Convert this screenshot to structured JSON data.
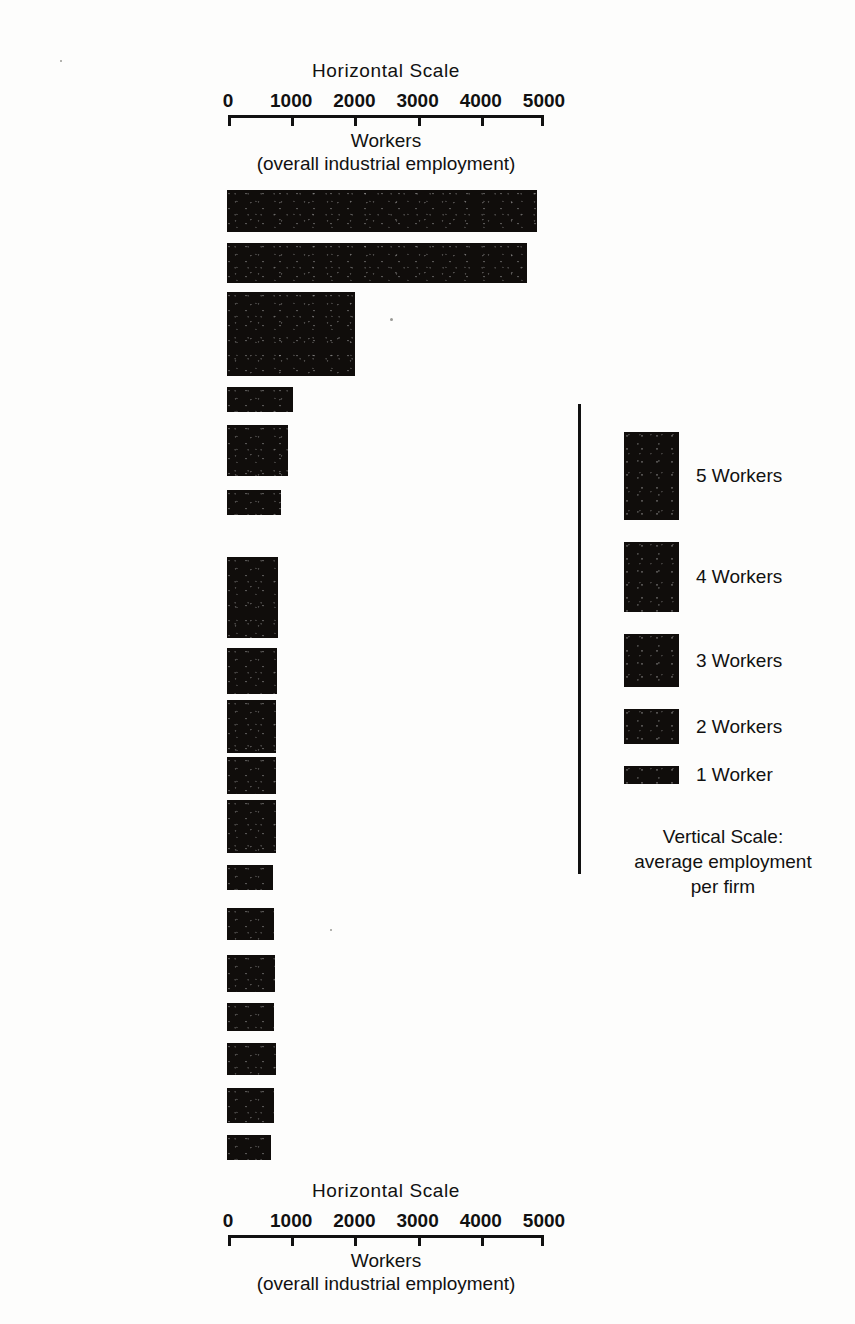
{
  "colors": {
    "bar": "#100d0b",
    "ink": "#111111",
    "page": "#fdfdfc"
  },
  "axis_top": {
    "title": "Horizontal Scale",
    "tick_labels": [
      "0",
      "1000",
      "2000",
      "3000",
      "4000",
      "5000"
    ],
    "tick_values": [
      0,
      1000,
      2000,
      3000,
      4000,
      5000
    ],
    "sub_label_1": "Workers",
    "sub_label_2": "(overall industrial employment)"
  },
  "axis_bottom": {
    "title": "Horizontal  Scale",
    "tick_labels": [
      "0",
      "1000",
      "2000",
      "3000",
      "4000",
      "5000"
    ],
    "tick_values": [
      0,
      1000,
      2000,
      3000,
      4000,
      5000
    ],
    "sub_label_1": "Workers",
    "sub_label_2": "(overall  industrial  employment)"
  },
  "legend": {
    "caption": "Vertical Scale:\naverage employment\nper firm",
    "entries": [
      {
        "label": "5 Workers",
        "workers": 5
      },
      {
        "label": "4 Workers",
        "workers": 4
      },
      {
        "label": "3 Workers",
        "workers": 3
      },
      {
        "label": "2 Workers",
        "workers": 2
      },
      {
        "label": "1 Worker",
        "workers": 1
      }
    ]
  },
  "chart_data": {
    "type": "bar",
    "title": "Horizontal Scale",
    "subtitle": "Workers (overall industrial employment)",
    "xlabel": "Workers (overall industrial employment)",
    "ylabel": "average employment per firm",
    "xlim": [
      0,
      5000
    ],
    "grid": false,
    "legend_position": "right",
    "categories": [
      "Tailoring",
      "Carpentry",
      "Motor repair",
      "Minor industries",
      "Baking",
      "Tinsmithing",
      "Printing",
      "Miscellaneous\nindustries",
      "Radio repair",
      "Blacksmithing",
      "Welding and battery\ncharging",
      "Shoe repair",
      "Photography",
      "Goldsmithing",
      "Mattress making",
      "Shoe making: rubber",
      "Shoe making",
      "Corn milling"
    ],
    "series": [
      {
        "name": "Workers (overall industrial employment)",
        "values": [
          4900,
          4740,
          2030,
          1050,
          960,
          860,
          810,
          790,
          780,
          780,
          780,
          720,
          740,
          760,
          740,
          780,
          740,
          700
        ]
      },
      {
        "name": "Average employment per firm (workers)",
        "values": [
          2.4,
          2.3,
          4.8,
          1.4,
          2.9,
          1.4,
          4.6,
          2.6,
          3.0,
          2.1,
          3.0,
          1.4,
          1.8,
          2.1,
          1.6,
          1.8,
          2.0,
          1.4
        ]
      }
    ]
  },
  "bars": [
    {
      "label": "Tailoring",
      "workers": 4900,
      "avg_per_firm": 2.4,
      "top": 190
    },
    {
      "label": "Carpentry",
      "workers": 4740,
      "avg_per_firm": 2.3,
      "top": 243
    },
    {
      "label": "Motor repair",
      "workers": 2030,
      "avg_per_firm": 4.8,
      "top": 292
    },
    {
      "label": "Minor industries",
      "workers": 1050,
      "avg_per_firm": 1.4,
      "top": 387
    },
    {
      "label": "Baking",
      "workers": 960,
      "avg_per_firm": 2.9,
      "top": 425
    },
    {
      "label": "Tinsmithing",
      "workers": 860,
      "avg_per_firm": 1.4,
      "top": 490
    },
    {
      "label": "Printing",
      "workers": 810,
      "avg_per_firm": 4.6,
      "top": 557
    },
    {
      "label": "Miscellaneous\nindustries",
      "workers": 790,
      "avg_per_firm": 2.6,
      "top": 648
    },
    {
      "label": "Radio repair",
      "workers": 780,
      "avg_per_firm": 3.0,
      "top": 700
    },
    {
      "label": "Blacksmithing",
      "workers": 780,
      "avg_per_firm": 2.1,
      "top": 757
    },
    {
      "label": "Welding and battery\ncharging",
      "workers": 780,
      "avg_per_firm": 3.0,
      "top": 800
    },
    {
      "label": "Shoe repair",
      "workers": 720,
      "avg_per_firm": 1.4,
      "top": 865
    },
    {
      "label": "Photography",
      "workers": 740,
      "avg_per_firm": 1.8,
      "top": 908
    },
    {
      "label": "Goldsmithing",
      "workers": 760,
      "avg_per_firm": 2.1,
      "top": 955
    },
    {
      "label": "Mattress making",
      "workers": 740,
      "avg_per_firm": 1.6,
      "top": 1003
    },
    {
      "label": "Shoe making: rubber",
      "workers": 780,
      "avg_per_firm": 1.8,
      "top": 1043
    },
    {
      "label": "Shoe making",
      "workers": 740,
      "avg_per_firm": 2.0,
      "top": 1088
    },
    {
      "label": "Corn milling",
      "workers": 700,
      "avg_per_firm": 1.4,
      "top": 1135
    }
  ]
}
